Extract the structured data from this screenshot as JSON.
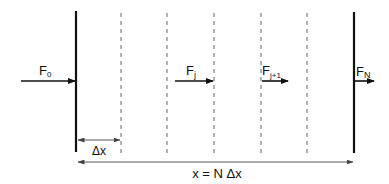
{
  "diagram": {
    "type": "flux-discretization",
    "colors": {
      "line": "#111111",
      "dashed": "#555555",
      "dimension": "#444444",
      "background": "#ffffff"
    },
    "boundaries": {
      "left_wall_x": 76,
      "right_wall_x": 354,
      "interior_dashed_x": [
        121,
        167,
        214,
        261,
        307
      ]
    },
    "fluxes": [
      {
        "id": "F0",
        "label": "F",
        "subscript": "0"
      },
      {
        "id": "Fj",
        "label": "F",
        "subscript": "j"
      },
      {
        "id": "Fj1",
        "label": "F",
        "subscript": "j+1"
      },
      {
        "id": "FN",
        "label": "F",
        "subscript": "N"
      }
    ],
    "dimensions": {
      "cell_width_label": "Δx",
      "total_length_label": "x = N Δx"
    }
  }
}
